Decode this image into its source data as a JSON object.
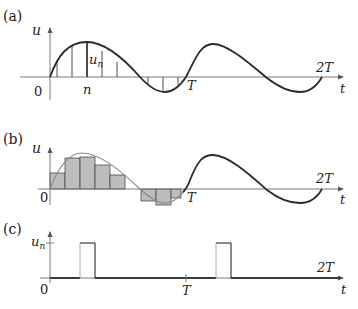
{
  "panels": {
    "a": {
      "label": "(a)",
      "y_axis_label": "u",
      "origin_label": "0",
      "sample_index_label": "n",
      "sample_value_label": "u",
      "sample_value_subscript": "n",
      "period_label": "T",
      "double_period_label": "2T",
      "x_axis_label": "t"
    },
    "b": {
      "label": "(b)",
      "y_axis_label": "u",
      "origin_label": "0",
      "period_label": "T",
      "double_period_label": "2T",
      "x_axis_label": "t"
    },
    "c": {
      "label": "(c)",
      "y_axis_label": "u",
      "y_axis_subscript": "n",
      "origin_label": "0",
      "period_label": "T",
      "double_period_label": "2T",
      "x_axis_label": "t"
    }
  },
  "colors": {
    "curve": "#2a2a2a",
    "axis": "#7a7a7a",
    "bar_fill": "#bdbdbd",
    "background": "#ffffff"
  }
}
